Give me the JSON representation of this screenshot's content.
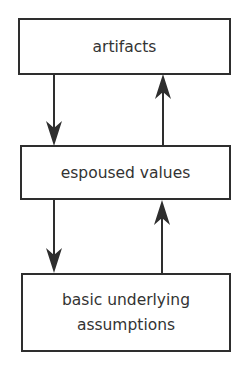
{
  "diagram": {
    "type": "flow",
    "levels": [
      {
        "label": "artifacts"
      },
      {
        "label": "espoused values"
      },
      {
        "label": "basic underlying assumptions",
        "lines": [
          "basic underlying",
          "assumptions"
        ]
      }
    ],
    "connections": [
      {
        "from": "artifacts",
        "to": "espoused values",
        "direction": "down"
      },
      {
        "from": "espoused values",
        "to": "artifacts",
        "direction": "up"
      },
      {
        "from": "espoused values",
        "to": "basic underlying assumptions",
        "direction": "down"
      },
      {
        "from": "basic underlying assumptions",
        "to": "espoused values",
        "direction": "up"
      }
    ],
    "colors": {
      "stroke": "#2e2e2e",
      "text": "#333333",
      "background": "#ffffff"
    }
  }
}
